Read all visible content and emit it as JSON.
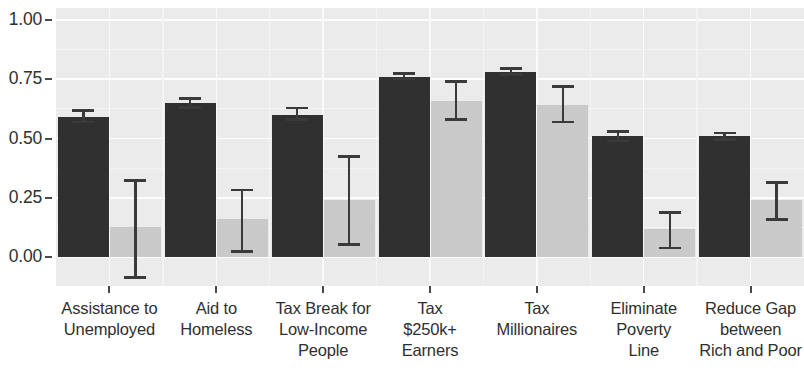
{
  "chart_data": {
    "type": "bar",
    "title": "",
    "subtitle": "",
    "xlabel": "",
    "ylabel": "",
    "ylim": [
      -0.12,
      1.05
    ],
    "yticks": [
      0.0,
      0.25,
      0.5,
      0.75,
      1.0
    ],
    "ytick_labels": [
      "0.00",
      "0.25",
      "0.50",
      "0.75",
      "1.00"
    ],
    "grid": true,
    "grid_orientation": "both",
    "legend": "none",
    "categories": [
      "Assistance to Unemployed",
      "Aid to Homeless",
      "Tax Break for Low-Income People",
      "Tax $250k+ Earners",
      "Tax Millionaires",
      "Eliminate Poverty Line",
      "Reduce Gap between Rich and Poor"
    ],
    "category_lines": [
      [
        "Assistance to",
        "Unemployed"
      ],
      [
        "Aid to",
        "Homeless"
      ],
      [
        "Tax Break for",
        "Low-Income",
        "People"
      ],
      [
        "Tax",
        "$250k+",
        "Earners"
      ],
      [
        "Tax",
        "Millionaires"
      ],
      [
        "Eliminate",
        "Poverty",
        "Line"
      ],
      [
        "Reduce Gap",
        "between",
        "Rich and Poor"
      ]
    ],
    "series": [
      {
        "name": "dark",
        "color": "#303030",
        "values": [
          0.59,
          0.65,
          0.6,
          0.76,
          0.78,
          0.51,
          0.51
        ],
        "err_low": [
          0.565,
          0.625,
          0.575,
          0.745,
          0.765,
          0.485,
          0.49
        ],
        "err_high": [
          0.625,
          0.675,
          0.635,
          0.78,
          0.8,
          0.535,
          0.53
        ]
      },
      {
        "name": "light",
        "color": "#c9c9c9",
        "values": [
          0.13,
          0.16,
          0.24,
          0.66,
          0.64,
          0.12,
          0.24
        ],
        "err_low": [
          -0.09,
          0.02,
          0.05,
          0.575,
          0.565,
          0.035,
          0.155
        ],
        "err_high": [
          0.33,
          0.29,
          0.43,
          0.745,
          0.725,
          0.195,
          0.32
        ]
      }
    ],
    "colors": {
      "panel_background": "#ebebeb",
      "gridline": "#ffffff",
      "axis_text": "#2f2f2f",
      "errorbar": "#3a3a3a",
      "page_background": "#ffffff"
    }
  }
}
